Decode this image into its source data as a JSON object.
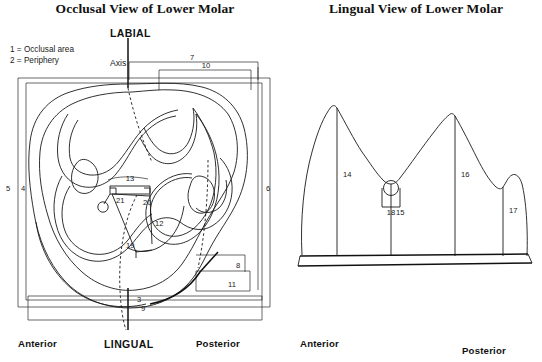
{
  "figure": {
    "kind": "anatomical-diagram"
  },
  "occlusal": {
    "title": "Occlusal View of Lower Molar",
    "legend": [
      "1 = Occlusal area",
      "2 = Periphery"
    ],
    "axis_label": "Axis",
    "top_label": "LABIAL",
    "bottom_label": "LINGUAL",
    "anterior_label": "Anterior",
    "posterior_label": "Posterior",
    "measure_numbers": {
      "n3": "3",
      "n4": "4",
      "n5": "5",
      "n6": "6",
      "n7": "7",
      "n8": "8",
      "n9": "9",
      "n10": "10",
      "n11": "11",
      "n12": "12",
      "n13": "13",
      "n19": "19",
      "n20": "20",
      "n21": "21"
    }
  },
  "lingual": {
    "title": "Lingual View of Lower Molar",
    "anterior_label": "Anterior",
    "posterior_label": "Posterior",
    "measure_numbers": {
      "n14": "14",
      "n15": "15",
      "n16": "16",
      "n17": "17",
      "n18": "18"
    }
  },
  "colors": {
    "ink": "#1a1a1a",
    "background": "#ffffff"
  }
}
